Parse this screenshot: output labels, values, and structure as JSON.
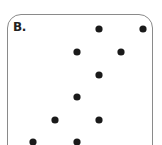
{
  "panel": {
    "label": "B.",
    "border_color": "#8a8a8a",
    "dot_color": "#1a1a1a"
  },
  "dots": [
    {
      "x": 99,
      "y": 29
    },
    {
      "x": 143,
      "y": 29
    },
    {
      "x": 77,
      "y": 52
    },
    {
      "x": 121,
      "y": 52
    },
    {
      "x": 99,
      "y": 75
    },
    {
      "x": 77,
      "y": 97
    },
    {
      "x": 55,
      "y": 120
    },
    {
      "x": 99,
      "y": 120
    },
    {
      "x": 33,
      "y": 142
    },
    {
      "x": 77,
      "y": 142
    }
  ]
}
